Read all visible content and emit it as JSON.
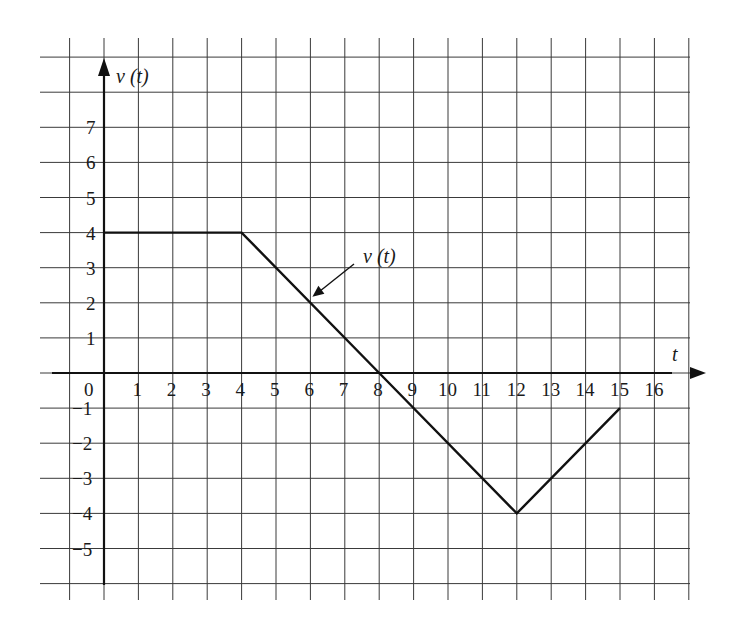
{
  "chart_data": {
    "type": "line",
    "title": "",
    "xlabel": "t",
    "ylabel": "v (t)",
    "series": [
      {
        "name": "v (t)",
        "x": [
          0,
          4,
          8,
          12,
          15
        ],
        "y": [
          4,
          4,
          0,
          -4,
          -1
        ]
      }
    ],
    "annotations": [
      {
        "text": "v (t)",
        "points_to": {
          "x": 6,
          "y": 2
        }
      }
    ],
    "x_ticks": [
      "0",
      "1",
      "2",
      "3",
      "4",
      "5",
      "6",
      "7",
      "8",
      "9",
      "10",
      "11",
      "12",
      "13",
      "14",
      "15",
      "16"
    ],
    "y_ticks": [
      "7",
      "6",
      "5",
      "4",
      "3",
      "2",
      "1",
      "−1",
      "−2",
      "−3",
      "−4",
      "−5"
    ],
    "xlim": [
      -1,
      17
    ],
    "ylim": [
      -6,
      9
    ],
    "grid": true,
    "legend": null
  },
  "colors": {
    "grid": "#3a3a3a",
    "axis": "#111111",
    "line": "#111111",
    "background": "#ffffff"
  }
}
